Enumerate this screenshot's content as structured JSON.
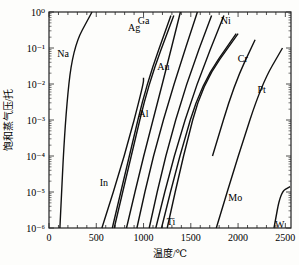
{
  "chart_data": {
    "type": "line",
    "title": "",
    "xlabel": "温度/℃",
    "ylabel": "饱和蒸气压/托",
    "xscale": "linear",
    "yscale": "log",
    "xlim": [
      0,
      2560
    ],
    "ylim": [
      1e-06,
      1
    ],
    "xticks": [
      0,
      500,
      1000,
      1500,
      2000,
      2500
    ],
    "xtick_labels": [
      "0",
      "500",
      "1000",
      "1500",
      "2000",
      "2500"
    ],
    "yticks": [
      1e-06,
      1e-05,
      0.0001,
      0.001,
      0.01,
      0.1,
      1
    ],
    "ytick_labels": [
      "10⁻⁶",
      "10⁻⁵",
      "10⁻⁴",
      "10⁻³",
      "10⁻²",
      "10⁻¹",
      "10⁰"
    ],
    "grid": false,
    "legend": "inline labels",
    "series": [
      {
        "name": "Na",
        "points": [
          [
            115,
            1e-06
          ],
          [
            170,
            0.001
          ],
          [
            250,
            0.1
          ],
          [
            455,
            1
          ]
        ],
        "label_at": [
          150,
          0.07
        ]
      },
      {
        "name": "In",
        "points": [
          [
            560,
            1e-06
          ],
          [
            800,
            0.0001
          ],
          [
            1000,
            0.01
          ],
          [
            1000,
            0.015
          ]
        ],
        "label_at": [
          580,
          1.8e-05
        ]
      },
      {
        "name": "Ag",
        "points": [
          [
            670,
            1e-06
          ],
          [
            850,
            0.0001
          ],
          [
            1030,
            0.01
          ],
          [
            1290,
            0.8
          ]
        ],
        "label_at": [
          900,
          0.35
        ]
      },
      {
        "name": "Ag_2",
        "points": [
          [
            690,
            1e-06
          ],
          [
            870,
            0.0001
          ],
          [
            1050,
            0.01
          ],
          [
            1320,
            0.8
          ]
        ],
        "label_at": null
      },
      {
        "name": "Al",
        "points": [
          [
            820,
            1e-06
          ],
          [
            1000,
            0.0001
          ],
          [
            1200,
            0.01
          ],
          [
            1390,
            1
          ]
        ],
        "label_at": [
          1000,
          0.0015
        ]
      },
      {
        "name": "Ga",
        "points": [
          [
            930,
            1e-06
          ],
          [
            1100,
            0.0001
          ],
          [
            1320,
            0.01
          ],
          [
            1570,
            1
          ]
        ],
        "label_at": [
          1000,
          0.55
        ]
      },
      {
        "name": "Au",
        "points": [
          [
            1060,
            1e-06
          ],
          [
            1230,
            0.0001
          ],
          [
            1450,
            0.01
          ],
          [
            1720,
            0.8
          ]
        ],
        "label_at": [
          1210,
          0.03
        ]
      },
      {
        "name": "Ni",
        "points": [
          [
            1130,
            1e-06
          ],
          [
            1320,
            0.0001
          ],
          [
            1560,
            0.01
          ],
          [
            1850,
            0.8
          ]
        ],
        "label_at": [
          1870,
          0.55
        ]
      },
      {
        "name": "Ti",
        "points": [
          [
            1190,
            1e-06
          ],
          [
            1380,
            0.0001
          ],
          [
            1610,
            0.01
          ],
          [
            1980,
            0.25
          ]
        ],
        "label_at": [
          1290,
          1.5e-06
        ]
      },
      {
        "name": "Cr",
        "points": [
          [
            1250,
            1e-06
          ],
          [
            1420,
            0.0001
          ],
          [
            1620,
            0.01
          ],
          [
            2000,
            0.25
          ]
        ],
        "label_at": [
          2050,
          0.05
        ]
      },
      {
        "name": "Pt",
        "points": [
          [
            1730,
            0.0001
          ],
          [
            1960,
            0.01
          ],
          [
            2180,
            0.17
          ]
        ],
        "label_at": [
          2250,
          0.007
        ]
      },
      {
        "name": "Mo",
        "points": [
          [
            1770,
            1e-06
          ],
          [
            2000,
            0.0001
          ],
          [
            2250,
            0.01
          ],
          [
            2470,
            0.1
          ]
        ],
        "label_at": [
          1970,
          7e-06
        ]
      },
      {
        "name": "W",
        "points": [
          [
            2380,
            1e-06
          ],
          [
            2450,
            1e-05
          ],
          [
            2550,
            1.4e-05
          ]
        ],
        "label_at": [
          2440,
          1.2e-06
        ]
      }
    ]
  },
  "labels": {
    "x_axis_title": "温度/℃",
    "y_axis_title": "饱和蒸气压/托"
  }
}
